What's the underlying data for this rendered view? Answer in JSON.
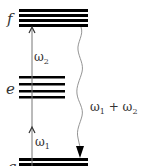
{
  "diagram": {
    "levels": [
      {
        "id": "f",
        "label": "f",
        "lines": 4
      },
      {
        "id": "e",
        "label": "e",
        "lines": 4
      },
      {
        "id": "g",
        "label": "g",
        "lines": 2
      }
    ],
    "transitions": [
      {
        "id": "omega1",
        "symbol": "ω",
        "subscript": "1",
        "from": "g",
        "to": "e",
        "style": "straight-up-arrow"
      },
      {
        "id": "omega2",
        "symbol": "ω",
        "subscript": "2",
        "from": "e",
        "to": "f",
        "style": "straight-up-arrow"
      },
      {
        "id": "omega-sum",
        "symbol_a": "ω",
        "sub_a": "1",
        "plus": "+",
        "symbol_b": "ω",
        "sub_b": "2",
        "from": "f",
        "to": "g",
        "style": "wavy-down-arrow"
      }
    ],
    "colors": {
      "level_line": "#000000",
      "arrow": "#666666",
      "text": "#333333"
    }
  }
}
